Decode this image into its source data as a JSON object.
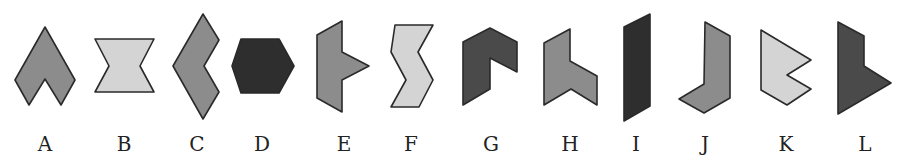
{
  "figure": {
    "colors": {
      "dark": "#2e2e2e",
      "dark_alt": "#4a4a4a",
      "medium": "#8c8c8c",
      "light": "#d4d4d4",
      "stroke": "#2a2a2a"
    },
    "shapes": [
      {
        "label": "A",
        "fill": "medium",
        "points": "45,27 75,80 61,105 45,79 29,105 15,80"
      },
      {
        "label": "B",
        "fill": "light",
        "points": "95,39 154,39 140,66 154,92 95,92 109,66"
      },
      {
        "label": "C",
        "fill": "medium",
        "points": "203,14 219,40 204,66 219,92 203,119 173,66"
      },
      {
        "label": "D",
        "fill": "dark",
        "points": "241,39 279,39 294,66 279,93 241,93 232,66"
      },
      {
        "label": "E",
        "fill": "medium",
        "points": "342,21 342,52 369,66 342,80 342,112 317,98 317,35"
      },
      {
        "label": "F",
        "fill": "light",
        "points": "395,25 433,25 418,52 433,80 419,107 391,107 406,80 391,52"
      },
      {
        "label": "G",
        "fill": "dark_alt",
        "points": "490,28 517,42 517,72 490,58 490,89 463,105 463,42"
      },
      {
        "label": "H",
        "fill": "medium",
        "points": "570,29 570,61 597,76 597,105 571,89 544,105 544,43"
      },
      {
        "label": "I",
        "fill": "dark",
        "points": "650,14 650,106 624,121 624,27"
      },
      {
        "label": "J",
        "fill": "medium",
        "points": "705,22 730,36 730,98 704,113 679,99 704,84"
      },
      {
        "label": "K",
        "fill": "light",
        "points": "761,30 811,60 787,75 811,89 787,105 761,90"
      },
      {
        "label": "L",
        "fill": "dark_alt",
        "points": "838,22 864,36 864,66 891,83 838,114"
      }
    ],
    "labels": [
      {
        "text": "A",
        "x": 45
      },
      {
        "text": "B",
        "x": 124
      },
      {
        "text": "C",
        "x": 197
      },
      {
        "text": "D",
        "x": 262
      },
      {
        "text": "E",
        "x": 344
      },
      {
        "text": "F",
        "x": 411
      },
      {
        "text": "G",
        "x": 491
      },
      {
        "text": "H",
        "x": 570
      },
      {
        "text": "I",
        "x": 636
      },
      {
        "text": "J",
        "x": 705
      },
      {
        "text": "K",
        "x": 786
      },
      {
        "text": "L",
        "x": 865
      }
    ],
    "label_baseline_y": 151
  }
}
